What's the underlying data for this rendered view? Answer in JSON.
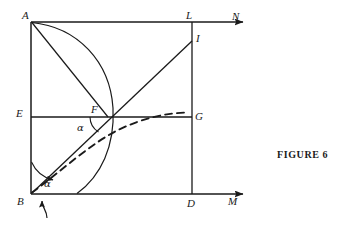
{
  "figure": {
    "caption": "FIGURE  6",
    "domain": "geometry-diagram",
    "stroke_color": "#1a1a1a",
    "background_color": "#ffffff"
  },
  "vertex_labels": [
    {
      "id": "A",
      "text": "A",
      "x": 22,
      "y": 10
    },
    {
      "id": "L",
      "text": "L",
      "x": 186,
      "y": 10
    },
    {
      "id": "N",
      "text": "N",
      "x": 232,
      "y": 11
    },
    {
      "id": "I",
      "text": "I",
      "x": 196,
      "y": 33
    },
    {
      "id": "E",
      "text": "E",
      "x": 16,
      "y": 108
    },
    {
      "id": "F",
      "text": "F",
      "x": 91,
      "y": 104
    },
    {
      "id": "G",
      "text": "G",
      "x": 195,
      "y": 111
    },
    {
      "id": "B",
      "text": "B",
      "x": 17,
      "y": 196
    },
    {
      "id": "D",
      "text": "D",
      "x": 187,
      "y": 198
    },
    {
      "id": "M",
      "text": "M",
      "x": 228,
      "y": 196
    }
  ],
  "angle_labels": [
    {
      "id": "alpha-at-F",
      "text": "α",
      "x": 77,
      "y": 123
    },
    {
      "id": "alpha-at-B",
      "text": "α",
      "x": 44,
      "y": 179
    }
  ],
  "geometry": {
    "points": {
      "A": {
        "x": 31,
        "y": 22
      },
      "B": {
        "x": 31,
        "y": 194
      },
      "D": {
        "x": 192,
        "y": 194
      },
      "L": {
        "x": 192,
        "y": 22
      },
      "E": {
        "x": 31,
        "y": 117
      },
      "F": {
        "x": 108,
        "y": 117
      },
      "G": {
        "x": 192,
        "y": 117
      },
      "I": {
        "x": 192,
        "y": 41
      },
      "N_end": {
        "x": 248,
        "y": 22
      },
      "M_end": {
        "x": 248,
        "y": 194
      }
    },
    "segments": [
      {
        "name": "AB-left-side",
        "from": "A",
        "to": "B"
      },
      {
        "name": "BM-bottom-axis",
        "from": "B",
        "to": "M_end",
        "arrow": true
      },
      {
        "name": "AN-top-axis",
        "from": "A",
        "to": "N_end",
        "arrow": true
      },
      {
        "name": "LD-right-side",
        "from": "L",
        "to": "D"
      },
      {
        "name": "EG-horizontal",
        "from": "E",
        "to": "G"
      },
      {
        "name": "AF-extended-chord",
        "from": "A",
        "to": "B"
      },
      {
        "name": "BI-ray",
        "from": "B",
        "to": "I"
      }
    ],
    "curves": [
      {
        "name": "circular-arc-A-to-bottom",
        "style": "solid"
      },
      {
        "name": "dashed-curve-B-to-G",
        "style": "dashed"
      }
    ],
    "annotations": [
      {
        "name": "angle-arc-at-F",
        "style": "arc"
      },
      {
        "name": "angle-arc-with-arrow-at-B",
        "style": "arc-arrow"
      },
      {
        "name": "pointer-arrow-below-B",
        "style": "hooked-arrow"
      }
    ]
  }
}
